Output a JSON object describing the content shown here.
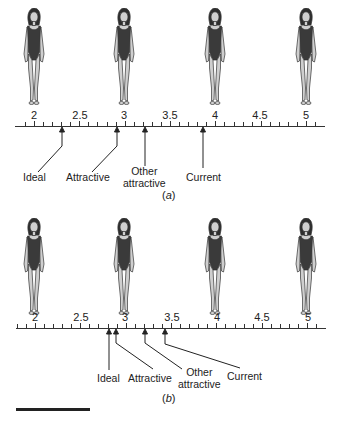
{
  "figure_a": {
    "caption_open": "(",
    "caption_letter": "a",
    "caption_close": ")",
    "scale_labels": [
      "2",
      "2.5",
      "3",
      "3.5",
      "4",
      "4.5",
      "5"
    ],
    "markers": [
      {
        "label_line1": "Ideal",
        "label_line2": "",
        "value": 2.3
      },
      {
        "label_line1": "Attractive",
        "label_line2": "",
        "value": 2.9
      },
      {
        "label_line1": "Other",
        "label_line2": "attractive",
        "value": 3.2
      },
      {
        "label_line1": "Current",
        "label_line2": "",
        "value": 3.85
      }
    ]
  },
  "figure_b": {
    "caption_open": "(",
    "caption_letter": "b",
    "caption_close": ")",
    "scale_labels": [
      "2",
      "2.5",
      "3",
      "3.5",
      "4",
      "4.5",
      "5"
    ],
    "markers": [
      {
        "label_line1": "Ideal",
        "label_line2": "",
        "value": 2.83
      },
      {
        "label_line1": "Attractive",
        "label_line2": "",
        "value": 2.9
      },
      {
        "label_line1": "Other",
        "label_line2": "attractive",
        "value": 3.2
      },
      {
        "label_line1": "Current",
        "label_line2": "",
        "value": 3.45
      }
    ]
  },
  "figure_silhouettes": [
    "2",
    "3",
    "4",
    "5"
  ],
  "colors": {
    "ink": "#222222",
    "swimsuit": "#3a3a3a",
    "skin": "#cfcfcf"
  }
}
